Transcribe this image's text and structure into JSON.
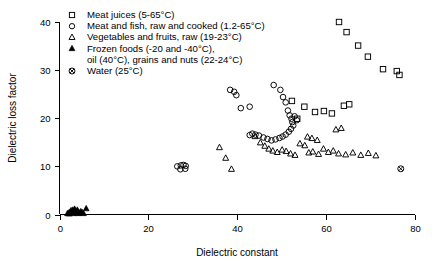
{
  "chart_data": {
    "type": "scatter",
    "title": "",
    "xlabel": "Dielectric constant",
    "ylabel": "Dielectric loss factor",
    "xlim": [
      0,
      80
    ],
    "ylim": [
      0,
      40
    ],
    "xticks": [
      0,
      20,
      40,
      60,
      80
    ],
    "yticks": [
      0,
      10,
      20,
      30,
      40
    ],
    "grid": false,
    "legend_position": "top-left",
    "series": [
      {
        "name": "Meat juices (5-65°C)",
        "marker": "open-square",
        "points": [
          [
            52.3,
            23.6
          ],
          [
            55.1,
            22.4
          ],
          [
            57.5,
            21.3
          ],
          [
            59.5,
            21.5
          ],
          [
            61.3,
            21.0
          ],
          [
            64.0,
            22.6
          ],
          [
            65.2,
            22.9
          ],
          [
            62.9,
            40.0
          ],
          [
            64.6,
            37.9
          ],
          [
            67.2,
            35.1
          ],
          [
            69.4,
            32.8
          ],
          [
            72.8,
            30.2
          ],
          [
            75.9,
            29.8
          ],
          [
            76.5,
            29.0
          ],
          [
            53.5,
            19.9
          ]
        ]
      },
      {
        "name": "Meat and fish, raw and cooked (1.2-65°C)",
        "marker": "open-circle",
        "points": [
          [
            26.5,
            10.0
          ],
          [
            27.3,
            10.2
          ],
          [
            27.9,
            10.3
          ],
          [
            28.4,
            10.1
          ],
          [
            27.2,
            9.4
          ],
          [
            28.3,
            9.5
          ],
          [
            38.4,
            25.9
          ],
          [
            39.3,
            25.5
          ],
          [
            39.8,
            24.8
          ],
          [
            40.8,
            22.1
          ],
          [
            42.8,
            22.4
          ],
          [
            48.2,
            26.9
          ],
          [
            49.7,
            25.9
          ],
          [
            50.3,
            24.4
          ],
          [
            50.9,
            23.3
          ],
          [
            51.4,
            21.6
          ],
          [
            51.8,
            20.6
          ],
          [
            52.2,
            19.9
          ],
          [
            52.4,
            19.2
          ],
          [
            52.6,
            18.5
          ],
          [
            52.1,
            17.8
          ],
          [
            51.6,
            17.2
          ],
          [
            50.9,
            16.6
          ],
          [
            50.2,
            16.2
          ],
          [
            49.5,
            15.9
          ],
          [
            48.6,
            15.6
          ],
          [
            47.7,
            15.4
          ],
          [
            46.8,
            15.7
          ],
          [
            45.9,
            16.0
          ],
          [
            44.9,
            16.4
          ],
          [
            44.1,
            16.6
          ],
          [
            43.4,
            16.8
          ],
          [
            42.8,
            16.5
          ],
          [
            52.9,
            20.4
          ],
          [
            53.4,
            19.6
          ]
        ]
      },
      {
        "name": "Vegetables and fruits, raw (19-23°C)",
        "marker": "open-triangle",
        "points": [
          [
            36.0,
            13.9
          ],
          [
            37.4,
            11.7
          ],
          [
            38.7,
            9.4
          ],
          [
            44.0,
            16.2
          ],
          [
            45.2,
            14.9
          ],
          [
            46.2,
            14.2
          ],
          [
            47.1,
            13.6
          ],
          [
            48.0,
            13.2
          ],
          [
            49.0,
            12.9
          ],
          [
            50.1,
            13.4
          ],
          [
            51.0,
            13.1
          ],
          [
            52.0,
            12.6
          ],
          [
            53.0,
            12.3
          ],
          [
            54.1,
            14.7
          ],
          [
            55.2,
            14.3
          ],
          [
            56.1,
            12.8
          ],
          [
            57.0,
            13.0
          ],
          [
            58.3,
            12.5
          ],
          [
            59.4,
            13.6
          ],
          [
            60.5,
            12.9
          ],
          [
            61.6,
            13.2
          ],
          [
            62.8,
            12.6
          ],
          [
            64.4,
            12.4
          ],
          [
            66.0,
            12.8
          ],
          [
            67.8,
            12.3
          ],
          [
            69.5,
            12.7
          ],
          [
            71.2,
            12.2
          ],
          [
            62.2,
            17.6
          ],
          [
            63.4,
            17.9
          ],
          [
            55.8,
            16.1
          ],
          [
            56.8,
            15.8
          ],
          [
            58.0,
            15.4
          ]
        ]
      },
      {
        "name": "Frozen foods (-20 and -40°C),",
        "name2": "oil (40°C), grains and nuts (22-24°C)",
        "marker": "filled-triangle",
        "points": [
          [
            1.8,
            0.2
          ],
          [
            2.1,
            0.3
          ],
          [
            2.4,
            0.5
          ],
          [
            2.6,
            0.8
          ],
          [
            2.8,
            0.4
          ],
          [
            3.0,
            0.9
          ],
          [
            3.2,
            0.6
          ],
          [
            3.4,
            1.1
          ],
          [
            3.6,
            0.7
          ],
          [
            3.8,
            0.4
          ],
          [
            4.0,
            0.9
          ],
          [
            4.2,
            0.5
          ],
          [
            4.5,
            0.3
          ],
          [
            4.8,
            0.6
          ],
          [
            5.1,
            0.4
          ],
          [
            6.0,
            1.2
          ],
          [
            2.2,
            0.1
          ],
          [
            3.1,
            0.2
          ],
          [
            4.1,
            0.2
          ],
          [
            5.4,
            0.2
          ]
        ]
      },
      {
        "name": "Water (25°C)",
        "marker": "crossed-circle",
        "points": [
          [
            76.8,
            9.5
          ]
        ]
      }
    ]
  },
  "legend": {
    "items": [
      {
        "marker": "open-square",
        "label": "Meat juices (5-65°C)"
      },
      {
        "marker": "open-circle",
        "label": "Meat and fish, raw and cooked (1.2-65°C)"
      },
      {
        "marker": "open-triangle",
        "label": "Vegetables and fruits, raw (19-23°C)"
      },
      {
        "marker": "filled-triangle",
        "label": "Frozen foods (-20 and -40°C),"
      },
      {
        "marker": "none",
        "label": "oil (40°C), grains and nuts (22-24°C)"
      },
      {
        "marker": "crossed-circle",
        "label": "Water (25°C)"
      }
    ]
  },
  "axes": {
    "x_title": "Dielectric constant",
    "y_title": "Dielectric loss factor",
    "x_tick_labels": [
      "0",
      "20",
      "40",
      "60",
      "80"
    ],
    "y_tick_labels": [
      "0",
      "10",
      "20",
      "30",
      "40"
    ]
  },
  "colors": {
    "foreground": "#000000",
    "background": "#ffffff"
  }
}
